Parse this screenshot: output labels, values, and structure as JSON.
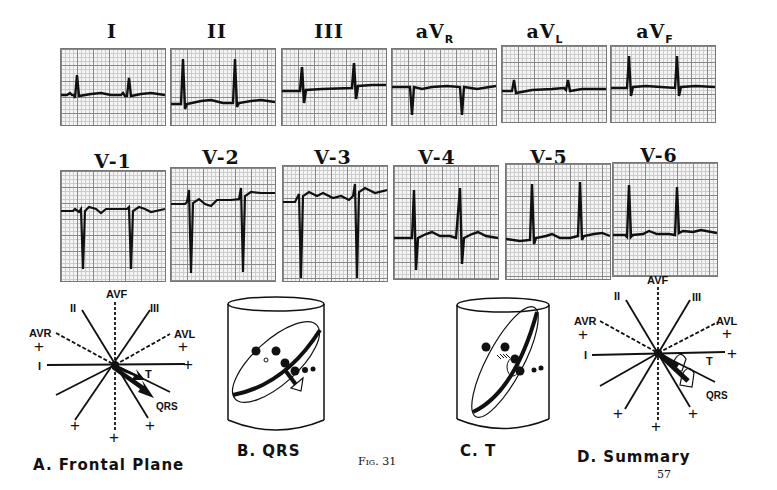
{
  "figure": {
    "label": "Fig. 31",
    "page_number": "57"
  },
  "limb_leads": [
    {
      "name": "I",
      "sub": ""
    },
    {
      "name": "II",
      "sub": ""
    },
    {
      "name": "III",
      "sub": ""
    },
    {
      "name": "aV",
      "sub": "R"
    },
    {
      "name": "aV",
      "sub": "L"
    },
    {
      "name": "aV",
      "sub": "F"
    }
  ],
  "precordial_leads": [
    {
      "name": "V-1"
    },
    {
      "name": "V-2"
    },
    {
      "name": "V-3"
    },
    {
      "name": "V-4"
    },
    {
      "name": "V-5"
    },
    {
      "name": "V-6"
    }
  ],
  "diagrams": {
    "a": {
      "caption": "A.   Frontal  Plane",
      "axis_labels": {
        "avf": "AVF",
        "ii": "II",
        "iii": "III",
        "avr": "AVR",
        "avl": "AVL",
        "i": "I"
      },
      "vector_labels": {
        "t": "T",
        "qrs": "QRS"
      },
      "plus": "+"
    },
    "b": {
      "caption": "B.   QRS"
    },
    "c": {
      "caption": "C.     T"
    },
    "d": {
      "caption": "D.   Summary",
      "axis_labels": {
        "avf": "AVF",
        "ii": "II",
        "iii": "III",
        "avr": "AVR",
        "avl": "AVL",
        "i": "I"
      },
      "vector_labels": {
        "t": "T",
        "qrs": "QRS"
      },
      "plus": "+"
    }
  },
  "colors": {
    "ink": "#111111",
    "grid_major": "#888888",
    "grid_minor": "#cccccc",
    "paper": "#f4f4f4"
  }
}
